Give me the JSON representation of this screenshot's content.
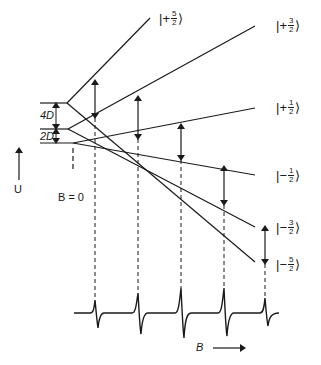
{
  "diagram": {
    "title": "",
    "type": "zeeman-energy-level-fan-with-epr-spectrum",
    "zero_field_splittings": [
      {
        "label": "4D",
        "between": [
          "±5/2",
          "±3/2"
        ]
      },
      {
        "label": "2D",
        "between": [
          "±3/2",
          "±1/2"
        ]
      }
    ],
    "energy_axis_label": "U",
    "zero_field_marker_label": "B = 0",
    "field_axis_label": "B",
    "states": [
      {
        "sign": "+",
        "num": "5",
        "den": "2",
        "label": "|+5/2⟩"
      },
      {
        "sign": "+",
        "num": "3",
        "den": "2",
        "label": "|+3/2⟩"
      },
      {
        "sign": "+",
        "num": "1",
        "den": "2",
        "label": "|+1/2⟩"
      },
      {
        "sign": "−",
        "num": "1",
        "den": "2",
        "label": "|−1/2⟩"
      },
      {
        "sign": "−",
        "num": "3",
        "den": "2",
        "label": "|−3/2⟩"
      },
      {
        "sign": "−",
        "num": "5",
        "den": "2",
        "label": "|−5/2⟩"
      }
    ],
    "transitions_count": 5,
    "spectrum": {
      "lines": 5,
      "shape": "first-derivative absorption"
    }
  },
  "colors": {
    "ink": "#1a1a1a",
    "background": "#ffffff"
  }
}
